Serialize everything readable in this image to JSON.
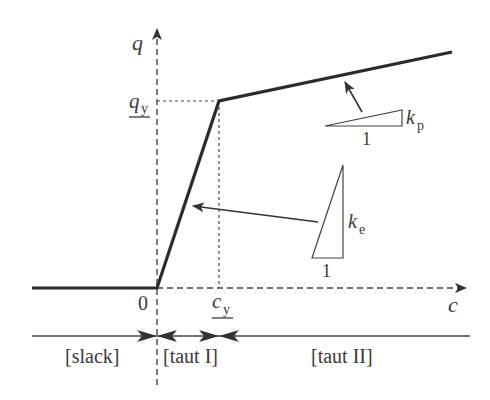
{
  "diagram": {
    "type": "piecewise-linear force-extension curve",
    "axes": {
      "x_label": "c",
      "y_label": "q",
      "origin_label": "0"
    },
    "points": {
      "yield_x_label": "c",
      "yield_x_sub": "y",
      "yield_y_label": "q",
      "yield_y_sub": "y"
    },
    "stiffness": {
      "elastic": {
        "symbol": "k",
        "sub": "e",
        "run_label": "1"
      },
      "plastic": {
        "symbol": "k",
        "sub": "p",
        "run_label": "1"
      }
    },
    "regions": [
      {
        "label": "[slack]"
      },
      {
        "label": "[taut I]"
      },
      {
        "label": "[taut II]"
      }
    ],
    "colors": {
      "curve": "#2b2b2b",
      "axis": "#444444",
      "text": "#3a3a3a"
    }
  }
}
